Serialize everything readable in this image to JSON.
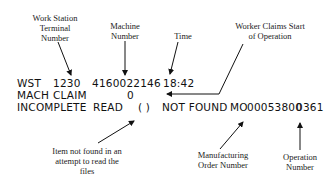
{
  "annotations": {
    "work_station": [
      "Work Station",
      "Terminal",
      "Number"
    ],
    "machine": [
      "Machine",
      "Number"
    ],
    "time": [
      "Time"
    ],
    "worker_claims": [
      "Worker Claims Start",
      "of Operation"
    ],
    "item_not_found": [
      "Item not found in an",
      "attempt to read the",
      "files"
    ],
    "mo_number": [
      "Manufacturing",
      "Order Number"
    ],
    "operation": [
      "Operation",
      "Number"
    ]
  },
  "terminal": {
    "row1": {
      "wst": "WST",
      "terminal": "1230",
      "machine": "4160022146",
      "time": "18:42"
    },
    "row2": {
      "mach": "MACH",
      "claim": "CLAIM",
      "value": "0"
    },
    "row3": {
      "status": "INCOMPLETE",
      "read": "READ",
      "paren": "( )",
      "not_found": "NOT FOUND",
      "mo": "MO",
      "mo_number": "00053800",
      "operation": "0361"
    }
  }
}
